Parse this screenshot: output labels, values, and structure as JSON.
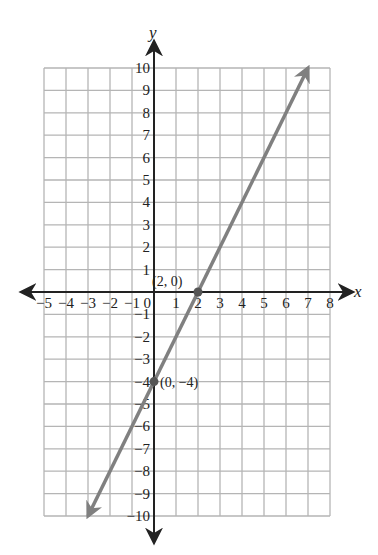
{
  "chart_data": {
    "type": "line",
    "title": "",
    "xlabel": "x",
    "ylabel": "y",
    "xlim": [
      -5,
      8
    ],
    "ylim": [
      -10,
      10
    ],
    "grid": true,
    "x_ticks": [
      -5,
      -4,
      -3,
      -2,
      -1,
      0,
      1,
      2,
      3,
      4,
      5,
      6,
      7,
      8
    ],
    "y_ticks": [
      -10,
      -9,
      -8,
      -7,
      -6,
      -5,
      -4,
      -3,
      -2,
      -1,
      1,
      2,
      3,
      4,
      5,
      6,
      7,
      8,
      9,
      10
    ],
    "series": [
      {
        "name": "y = 2x - 4",
        "x": [
          -3,
          7
        ],
        "y": [
          -10,
          10
        ],
        "color": "#808080",
        "arrows": "both"
      }
    ],
    "points": [
      {
        "x": 2,
        "y": 0,
        "label": "(2, 0)"
      },
      {
        "x": 0,
        "y": -4,
        "label": "(0, −4)"
      }
    ]
  },
  "labels": {
    "x_axis": "x",
    "y_axis": "y",
    "origin": "0",
    "point_a": "(2, 0)",
    "point_b": "(0, −4)"
  },
  "colors": {
    "grid": "#b5b5b5",
    "axis": "#222222",
    "line": "#808080",
    "point": "#555555"
  }
}
